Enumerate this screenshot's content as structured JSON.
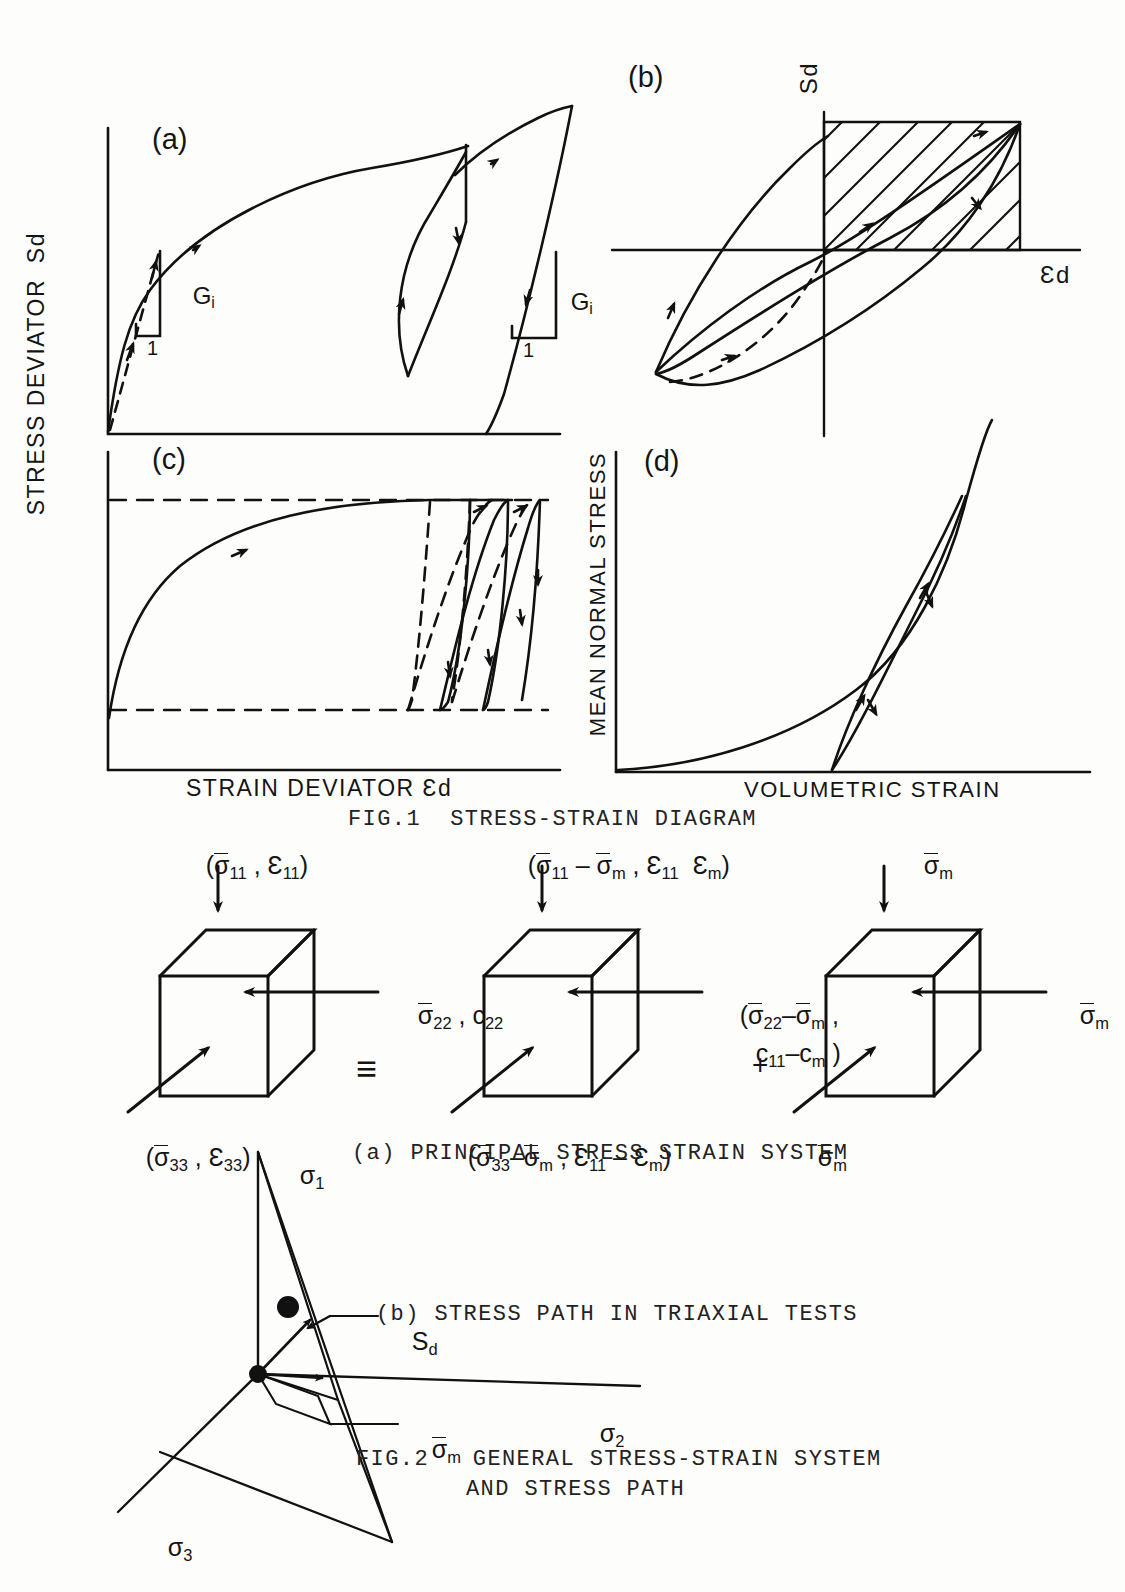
{
  "figure1": {
    "caption": "FIG.1  STRESS-STRAIN DIAGRAM",
    "y_axis_label": "STRESS DEVIATOR  Sd",
    "x_axis_label": "STRAIN DEVIATOR Ɛd",
    "panels": [
      {
        "id": "a",
        "label": "(a)",
        "annotations": [
          "G",
          "i",
          "1"
        ],
        "modulus_symbol": "G",
        "modulus_subscript": "i",
        "slope_run_label": "1",
        "description": "Monotonic backbone curve with two unload-reload hysteresis loops; initial shear modulus Gi tangent triangles at origin and at reload point"
      },
      {
        "id": "b",
        "label": "(b)",
        "y_axis": "Sd",
        "x_axis": "Ɛd",
        "description": "Single symmetric hysteresis loop through the origin with hatched rectangle of maximum strain energy and dashed skeleton curve"
      },
      {
        "id": "c",
        "label": "(c)",
        "description": "Backbone curve reaching an upper bound dashed line with repeated unloading loops between upper and lower dashed bounds; dashed interior loops"
      },
      {
        "id": "d",
        "label": "(d)",
        "y_axis_label": "MEAN NORMAL STRESS",
        "x_axis_label": "VOLUMETRIC STRAIN",
        "description": "Concave-up volumetric compression curve with a narrow unload-reload loop"
      }
    ]
  },
  "figure2": {
    "caption_line1": "FIG.2   GENERAL STRESS-STRAIN SYSTEM",
    "caption_line2": "AND STRESS PATH",
    "subcaption_a": "(a) PRINCIPAL STRESS STRAIN SYSTEM",
    "subcaption_b": "(b) STRESS PATH IN TRIAXIAL TESTS",
    "equiv_symbol": "≡",
    "plus_symbol": "+",
    "cubes": [
      {
        "id": "total",
        "top_label": "(σ11 , Ɛ11)",
        "right_label": "σ22 , c22",
        "bottom_label": "(σ33 , Ɛ33)"
      },
      {
        "id": "deviatoric",
        "top_label": "(σ11 − σm , Ɛ11   Ɛm)",
        "right_label_line1": "(σ22−σm ,",
        "right_label_line2": "c11−cm )",
        "bottom_label": "(σ33−σm , Ɛ11 − Ɛm)"
      },
      {
        "id": "hydrostatic",
        "top_label": "σm",
        "right_label": "σm",
        "bottom_label": "σm"
      }
    ],
    "stress_path": {
      "axis_1": "σ1",
      "axis_2": "σ2",
      "axis_3": "σ3",
      "point_label": "Sd",
      "hydrostatic_label": "σm"
    }
  }
}
